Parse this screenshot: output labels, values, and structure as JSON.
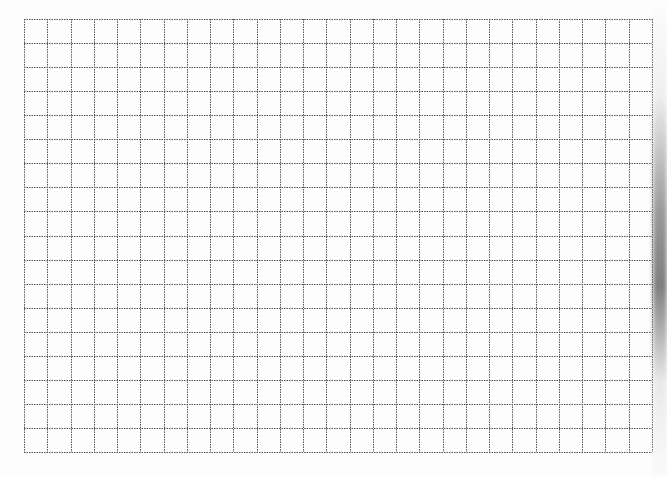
{
  "grid": {
    "left": 24,
    "top": 19,
    "right": 652,
    "bottom": 452,
    "columns": 27,
    "rows": 18,
    "line_color": "#555555",
    "line_style": "dotted",
    "background": "#ffffff"
  },
  "edge_shadow": {
    "side": "right",
    "color": "#888888"
  }
}
